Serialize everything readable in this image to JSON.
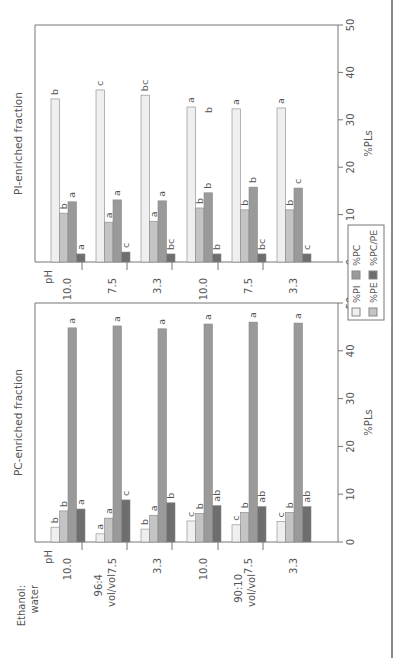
{
  "figure": {
    "row_header_label": "Ethanol:\nwater",
    "ph_label": "pH",
    "legend": [
      {
        "key": "PI",
        "label": "%PI",
        "color": "#efefef"
      },
      {
        "key": "PE",
        "label": "%PE",
        "color": "#c4c4c4"
      },
      {
        "key": "PC",
        "label": "%PC",
        "color": "#9a9a9a"
      },
      {
        "key": "PCPE",
        "label": "%PC/PE",
        "color": "#6e6e6e"
      }
    ]
  },
  "chart_data": [
    {
      "type": "bar",
      "orientation": "horizontal-in-rotated-page",
      "title": "PC-enriched fraction",
      "xlabel": "%PLs",
      "ylabel": "Ethanol:water / pH",
      "xlim": [
        0,
        50
      ],
      "ticks": [
        0,
        10,
        20,
        30,
        40,
        50
      ],
      "groups": [
        {
          "solvent": "96:4 vol/vol",
          "ph": [
            "10.0",
            "7.5",
            "3.3"
          ]
        },
        {
          "solvent": "90:10 vol/vol",
          "ph": [
            "10.0",
            "7.5",
            "3.3"
          ]
        }
      ],
      "categories": [
        "96:4 pH 10.0",
        "96:4 pH 7.5",
        "96:4 pH 3.3",
        "90:10 pH 10.0",
        "90:10 pH 7.5",
        "90:10 pH 3.3"
      ],
      "category_labels": [
        "10.0",
        "7.5",
        "3.3",
        "10.0",
        "7.5",
        "3.3"
      ],
      "series": [
        {
          "name": "%PI",
          "values": [
            3.1,
            1.7,
            2.7,
            4.4,
            3.6,
            4.3
          ],
          "letters": [
            "b",
            "a",
            "b",
            "c",
            "c",
            "c"
          ]
        },
        {
          "name": "%PE",
          "values": [
            6.5,
            5.0,
            5.6,
            6.0,
            6.2,
            6.2
          ],
          "letters": [
            "b",
            "a",
            "a",
            "b",
            "b",
            "b"
          ]
        },
        {
          "name": "%PC",
          "values": [
            44.8,
            45.2,
            44.6,
            45.6,
            46.0,
            45.8
          ],
          "letters": [
            "a",
            "a",
            "a",
            "a",
            "a",
            "a"
          ]
        },
        {
          "name": "%PC/PE",
          "values": [
            6.9,
            8.8,
            8.2,
            7.6,
            7.4,
            7.4
          ],
          "letters": [
            "a",
            "c",
            "b",
            "ab",
            "ab",
            "ab"
          ]
        }
      ],
      "grid": false
    },
    {
      "type": "bar",
      "orientation": "horizontal-in-rotated-page",
      "title": "PI-enriched fraction",
      "xlabel": "%PLs",
      "ylabel": "Ethanol:water / pH",
      "xlim": [
        0,
        50
      ],
      "ticks": [
        0,
        10,
        20,
        30,
        40,
        50
      ],
      "groups": [
        {
          "solvent": "96:4 vol/vol",
          "ph": [
            "10.0",
            "7.5",
            "3.3"
          ]
        },
        {
          "solvent": "90:10 vol/vol",
          "ph": [
            "10.0",
            "7.5",
            "3.3"
          ]
        }
      ],
      "categories": [
        "96:4 pH 10.0",
        "96:4 pH 7.5",
        "96:4 pH 3.3",
        "90:10 pH 10.0",
        "90:10 pH 7.5",
        "90:10 pH 3.3"
      ],
      "category_labels": [
        "10.0",
        "7.5",
        "3.3",
        "10.0",
        "7.5",
        "3.3"
      ],
      "series": [
        {
          "name": "%PI",
          "values": [
            34.4,
            36.3,
            35.2,
            32.7,
            32.3,
            32.5
          ],
          "letters": [
            "b",
            "c",
            "bc",
            "a",
            "a",
            "a"
          ]
        },
        {
          "name": "%PE",
          "values": [
            10.3,
            8.4,
            8.6,
            11.4,
            11.0,
            11.0
          ],
          "letters": [
            "b",
            "a",
            "a",
            "b",
            "b",
            "b"
          ]
        },
        {
          "name": "%PC",
          "values": [
            12.7,
            13.1,
            12.9,
            14.6,
            15.8,
            15.6
          ],
          "letters": [
            "a",
            "a",
            "a",
            "b",
            "b",
            "c"
          ]
        },
        {
          "name": "%PC/PE",
          "values": [
            1.7,
            2.1,
            1.7,
            1.7,
            1.7,
            1.7
          ],
          "letters": [
            "a",
            "c",
            "bc",
            "b",
            "bc",
            "c"
          ]
        }
      ],
      "floating_annotation": "b",
      "grid": false
    }
  ]
}
